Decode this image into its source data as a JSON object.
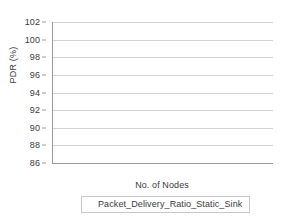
{
  "chart_data": {
    "type": "bar",
    "title": "",
    "xlabel": "No. of Nodes",
    "ylabel": "PDR (%)",
    "categories": [
      "25",
      "50"
    ],
    "series": [
      {
        "name": "Packet_Delivery_Ratio_Static_Sink",
        "values": [
          94.59,
          91
        ],
        "labels": [
          "94.59",
          "91"
        ],
        "color": "#808080"
      },
      {
        "name": "series-2",
        "values": [
          100,
          100
        ],
        "labels": [
          "100",
          "100"
        ],
        "color": "#bfbfbf"
      }
    ],
    "ylim": [
      86,
      102
    ],
    "yticks": [
      86,
      88,
      90,
      92,
      94,
      96,
      98,
      100,
      102
    ],
    "ytick_labels": [
      "86",
      "88",
      "90",
      "92",
      "94",
      "96",
      "98",
      "100",
      "102"
    ],
    "grid": "horizontal",
    "legend_position": "bottom"
  },
  "legend": {
    "entries": [
      {
        "label": "Packet_Delivery_Ratio_Static_Sink",
        "color": "#808080"
      }
    ]
  },
  "colors": {
    "series_1": "#808080",
    "series_2": "#bfbfbf",
    "gridline": "#d2d2d2",
    "axis": "#9a9a9a",
    "text": "#3a3a3a",
    "background": "#ffffff"
  }
}
